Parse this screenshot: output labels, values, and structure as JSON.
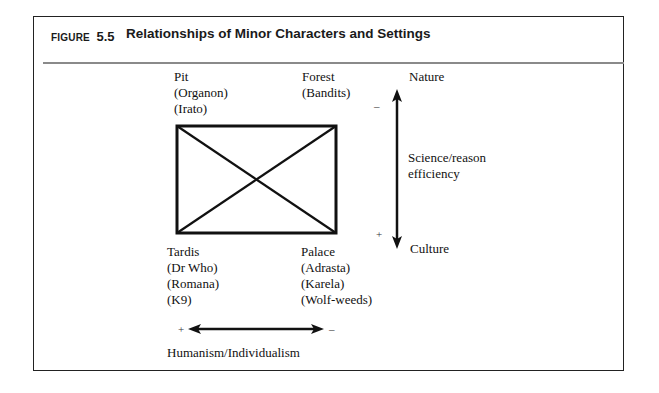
{
  "figure": {
    "label": "FIGURE",
    "number": "5.5",
    "title": "Relationships of Minor Characters and Settings"
  },
  "corners": {
    "top_left": {
      "setting": "Pit",
      "characters": [
        "(Organon)",
        "(Irato)"
      ]
    },
    "top_right": {
      "setting": "Forest",
      "characters": [
        "(Bandits)"
      ]
    },
    "bottom_left": {
      "setting": "Tardis",
      "characters": [
        "(Dr Who)",
        "(Romana)",
        "(K9)"
      ]
    },
    "bottom_right": {
      "setting": "Palace",
      "characters": [
        "(Adrasta)",
        "(Karela)",
        "(Wolf-weeds)"
      ]
    }
  },
  "vertical_axis": {
    "top_label": "Nature",
    "middle_label_line1": "Science/reason",
    "middle_label_line2": "efficiency",
    "bottom_label": "Culture",
    "top_sign": "–",
    "bottom_sign": "+"
  },
  "horizontal_axis": {
    "label": "Humanism/Individualism",
    "left_sign": "+",
    "right_sign": "–"
  },
  "colors": {
    "ink": "#111111",
    "frame": "#222222",
    "separator": "#8a8a8a"
  }
}
